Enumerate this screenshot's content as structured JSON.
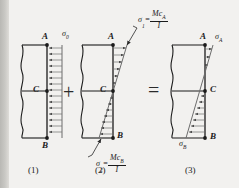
{
  "figure": {
    "type": "stress-superposition-diagram",
    "operators": {
      "plus": "+",
      "equals": "="
    },
    "captions": {
      "one": "(1)",
      "two": "(2)",
      "three": "(3)"
    }
  },
  "panel1": {
    "caption": "(1)",
    "points": {
      "a": "A",
      "b": "B",
      "c": "C"
    },
    "stress_label": "σ",
    "stress_sub": "0",
    "distribution": "uniform",
    "arrow_count": 15
  },
  "panel2": {
    "caption": "(2)",
    "points": {
      "a": "A",
      "b": "B",
      "c": "C"
    },
    "top_label": {
      "sigma": "σ",
      "sub": "1",
      "eq": "=",
      "num_m": "M",
      "num_c": "c",
      "num_sub": "A",
      "den": "I"
    },
    "bottom_label": {
      "sigma": "σ",
      "sub": "2",
      "eq": "=",
      "num_m": "M",
      "num_c": "c",
      "num_sub": "B",
      "den": "I"
    },
    "distribution": "linear-bending",
    "arrow_count_top": 5,
    "arrow_count_bottom": 9
  },
  "panel3": {
    "caption": "(3)",
    "points": {
      "a": "A",
      "b": "B",
      "c": "C"
    },
    "top_stress": {
      "sigma": "σ",
      "sub": "A"
    },
    "bottom_stress": {
      "sigma": "σ",
      "sub": "B"
    },
    "distribution": "combined",
    "arrow_count_top": 3,
    "arrow_count_bottom": 8
  },
  "colors": {
    "ink": "#1b1b1b",
    "hatch": "#6d6d6d",
    "background": "#f2f1ef",
    "band": "#c9c8c4"
  }
}
